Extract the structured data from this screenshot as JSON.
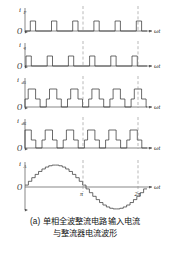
{
  "figure": {
    "caption_line1": "(a) 单相全波整流电路输入电流",
    "caption_line2": "与整流器电流波形",
    "origin_label": "O",
    "x_axis_label": "ωt",
    "colors": {
      "curve": "#3a3a3a",
      "axis": "#555555",
      "dashed": "#8a8a8a",
      "text": "#1a1a1a",
      "background": "#ffffff"
    }
  },
  "chart_data": {
    "type": "line",
    "xlabel": "ωt",
    "ylabel": "",
    "grid": false,
    "legend_position": "none",
    "xlim": [
      0,
      6.2832
    ],
    "x_ticks": [
      {
        "value": 3.1416,
        "label": "π"
      },
      {
        "value": 6.2832,
        "label": "2π"
      }
    ],
    "dashed_verticals": [
      3.1416,
      6.2832
    ],
    "panels": [
      {
        "name": "i_P",
        "label_base": "i",
        "label_sub": "P",
        "waveform": "narrow-pulse-train",
        "description": "六个窄矩形脉冲，每半周三个",
        "ylim": [
          0,
          1.2
        ],
        "pulses": [
          {
            "start": 0.26,
            "end": 0.52,
            "level": 1
          },
          {
            "start": 1.31,
            "end": 1.57,
            "level": 1
          },
          {
            "start": 2.36,
            "end": 2.62,
            "level": 1
          },
          {
            "start": 3.4,
            "end": 3.66,
            "level": 1
          },
          {
            "start": 4.45,
            "end": 4.71,
            "level": 1
          },
          {
            "start": 5.5,
            "end": 5.76,
            "level": 1
          }
        ]
      },
      {
        "name": "i_q",
        "label_base": "i",
        "label_sub": "q",
        "waveform": "narrow-pulse-train",
        "description": "六个窄矩形脉冲，相对 i_P 有相移",
        "ylim": [
          0,
          1.2
        ],
        "pulses": [
          {
            "start": 0.05,
            "end": 0.31,
            "level": 1
          },
          {
            "start": 1.1,
            "end": 1.36,
            "level": 1
          },
          {
            "start": 2.15,
            "end": 2.41,
            "level": 1
          },
          {
            "start": 3.19,
            "end": 3.45,
            "level": 1
          },
          {
            "start": 4.24,
            "end": 4.5,
            "level": 1
          },
          {
            "start": 5.29,
            "end": 5.55,
            "level": 1
          }
        ]
      },
      {
        "name": "i_d5",
        "label_base": "i",
        "label_sub": "d5",
        "waveform": "stepped-pulse-train",
        "description": "六个三电平阶梯脉冲（低台阶-高台阶-低台阶）",
        "ylim": [
          0,
          1.2
        ],
        "step_low": 0.45,
        "step_high": 1.0,
        "pulses": [
          {
            "start": 0.0,
            "rise": 0.16,
            "fall": 0.52,
            "end": 0.74
          },
          {
            "start": 1.05,
            "rise": 1.21,
            "fall": 1.57,
            "end": 1.79
          },
          {
            "start": 2.09,
            "rise": 2.25,
            "fall": 2.62,
            "end": 2.83
          },
          {
            "start": 3.14,
            "rise": 3.3,
            "fall": 3.66,
            "end": 3.88
          },
          {
            "start": 4.19,
            "rise": 4.35,
            "fall": 4.71,
            "end": 4.93
          },
          {
            "start": 5.24,
            "rise": 5.4,
            "fall": 5.76,
            "end": 5.98
          }
        ]
      },
      {
        "name": "i_d6",
        "label_base": "i",
        "label_sub": "d6",
        "waveform": "stepped-pulse-train",
        "description": "六个三电平阶梯脉冲，相对 i_d5 有相移",
        "ylim": [
          0,
          1.2
        ],
        "step_low": 0.45,
        "step_high": 1.0,
        "pulses": [
          {
            "start": -0.1,
            "rise": 0.05,
            "fall": 0.41,
            "end": 0.63
          },
          {
            "start": 0.94,
            "rise": 1.1,
            "fall": 1.46,
            "end": 1.68
          },
          {
            "start": 1.99,
            "rise": 2.15,
            "fall": 2.51,
            "end": 2.72
          },
          {
            "start": 3.03,
            "rise": 3.19,
            "fall": 3.56,
            "end": 3.77
          },
          {
            "start": 4.08,
            "rise": 4.24,
            "fall": 4.6,
            "end": 4.82
          },
          {
            "start": 5.13,
            "rise": 5.29,
            "fall": 5.65,
            "end": 5.87
          }
        ]
      },
      {
        "name": "i_A",
        "label_base": "i",
        "label_sub": "A",
        "waveform": "stepped-sine",
        "description": "阶梯逼近正弦的输入电流波形，一个完整周期",
        "ylim": [
          -1.15,
          1.15
        ],
        "steps_per_period": 36,
        "amplitude": 1.0
      }
    ]
  }
}
